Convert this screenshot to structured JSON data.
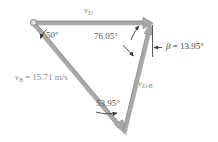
{
  "figure": {
    "type": "vector-triangle-diagram",
    "background_color": "#ffffff",
    "vector_color": "#a9a9a9",
    "vector_edge_color": "#8f8f8f",
    "annotation_color": "#555555",
    "label_color": "#8a8a8a"
  },
  "vectors": [
    {
      "id": "vD",
      "label": "v",
      "subscript": "D",
      "description": "horizontal velocity vector pointing right along the top",
      "from": [
        33,
        23
      ],
      "to": [
        152,
        23
      ],
      "color": "#a9a9a9"
    },
    {
      "id": "vB",
      "label": "v",
      "subscript": "B",
      "magnitude_text": "= 15.71 m/s",
      "full_label": "v_B = 15.71 m/s",
      "description": "velocity vector pointing down and to the right",
      "from": [
        33,
        23
      ],
      "to": [
        125,
        133
      ],
      "color": "#a9a9a9"
    },
    {
      "id": "vDB",
      "label": "v",
      "subscript": "D/B",
      "description": "relative velocity vector pointing up and slightly right",
      "from": [
        125,
        133
      ],
      "to": [
        150,
        24
      ],
      "color": "#a9a9a9"
    }
  ],
  "angles": [
    {
      "id": "angle-50",
      "text": "50°",
      "value": 50,
      "unit": "degrees",
      "at_vertex": "top-left",
      "label_pos": [
        42,
        32
      ]
    },
    {
      "id": "angle-76-05",
      "text": "76.05°",
      "value": 76.05,
      "unit": "degrees",
      "at_vertex": "top-right",
      "label_pos": [
        96,
        32
      ]
    },
    {
      "id": "angle-53-95",
      "text": "53.95°",
      "value": 53.95,
      "unit": "degrees",
      "at_vertex": "bottom",
      "label_pos": [
        98,
        99
      ]
    },
    {
      "id": "angle-beta",
      "symbol": "β",
      "text": "= 13.95°",
      "full_text": "β = 13.95°",
      "value": 13.95,
      "unit": "degrees",
      "at_vertex": "top-right-vertical-reference",
      "label_pos": [
        163,
        47
      ]
    }
  ],
  "markers": [
    {
      "id": "origin-dot",
      "shape": "open-circle",
      "pos": [
        33,
        23
      ],
      "description": "open circle marking the tail of vD and vB"
    }
  ],
  "reference_lines": [
    {
      "id": "vertical-reference",
      "description": "vertical dashed/solid reference line used to measure beta",
      "from": [
        152,
        24
      ],
      "to": [
        152,
        58
      ]
    }
  ]
}
